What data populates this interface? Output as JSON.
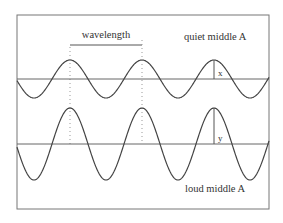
{
  "diagram": {
    "frame": {
      "x": 17,
      "y": 15,
      "width": 252,
      "height": 194
    },
    "wavelength_label": "wavelength",
    "quiet": {
      "label": "quiet middle A",
      "amplitude_label": "x",
      "baseline_y": 79,
      "amplitude": 19
    },
    "loud": {
      "label": "loud middle A",
      "amplitude_label": "y",
      "baseline_y": 144,
      "amplitude": 36
    },
    "wave": {
      "period": 72,
      "first_peak_x": 70,
      "peaks_x": [
        70,
        142,
        214
      ]
    },
    "colors": {
      "line": "#555555",
      "text": "#333333",
      "dotted": "#999999"
    }
  }
}
